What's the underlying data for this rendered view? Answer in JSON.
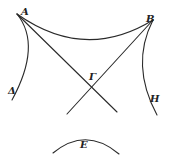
{
  "figure": {
    "type": "geometric-diagram",
    "labels": {
      "A": "A",
      "B": "B",
      "Gamma": "Γ",
      "Delta": "Δ",
      "H": "H",
      "E": "E"
    },
    "stroke_color": "#2a2a2a",
    "background": "#ffffff"
  }
}
